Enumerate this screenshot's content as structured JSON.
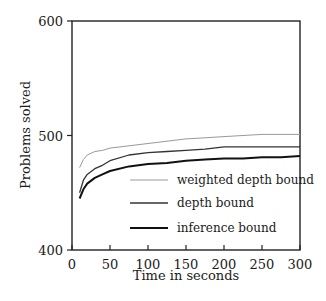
{
  "chart_data": {
    "type": "line",
    "title": "",
    "xlabel": "Time in seconds",
    "ylabel": "Problems solved",
    "xlim": [
      0,
      300
    ],
    "ylim": [
      400,
      600
    ],
    "xticks": [
      0,
      50,
      100,
      150,
      200,
      250,
      300
    ],
    "yticks": [
      400,
      500,
      600
    ],
    "grid": false,
    "legend_position": "lower right (inside)",
    "x": [
      10,
      15,
      20,
      30,
      40,
      50,
      75,
      100,
      125,
      150,
      175,
      200,
      225,
      250,
      275,
      300
    ],
    "series": [
      {
        "name": "weighted depth bound",
        "color": "#9a9a9a",
        "width": 1,
        "values": [
          472,
          479,
          483,
          486,
          487,
          489,
          491,
          493,
          495,
          497,
          498,
          499,
          500,
          501,
          501,
          501
        ]
      },
      {
        "name": "depth bound",
        "color": "#333333",
        "width": 1.3,
        "values": [
          450,
          461,
          466,
          471,
          474,
          478,
          483,
          485,
          486,
          487,
          488,
          490,
          490,
          490,
          490,
          490
        ]
      },
      {
        "name": "inference bound",
        "color": "#111111",
        "width": 2,
        "values": [
          445,
          453,
          458,
          463,
          466,
          469,
          473,
          475,
          476,
          478,
          479,
          480,
          480,
          481,
          481,
          482
        ]
      }
    ]
  },
  "axes": {
    "xlabel": "Time in seconds",
    "ylabel": "Problems solved",
    "xtick_labels": [
      "0",
      "50",
      "100",
      "150",
      "200",
      "250",
      "300"
    ],
    "ytick_labels": [
      "400",
      "500",
      "600"
    ]
  },
  "legend": [
    {
      "label": "weighted depth bound"
    },
    {
      "label": "depth bound"
    },
    {
      "label": "inference bound"
    }
  ]
}
